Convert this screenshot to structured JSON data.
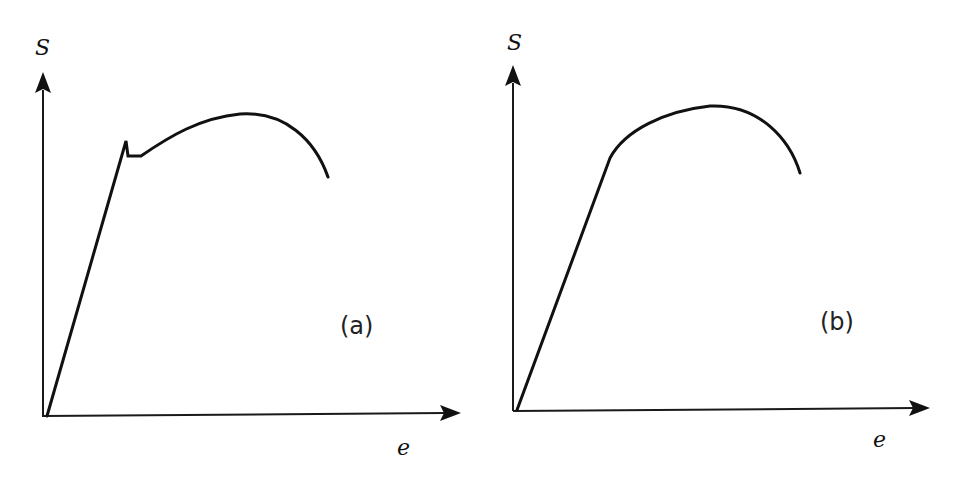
{
  "figure": {
    "panels": [
      {
        "id": "a",
        "label": "(a)",
        "y_axis_label": "S",
        "x_axis_label": "e",
        "curve_type": "discontinuous-yield"
      },
      {
        "id": "b",
        "label": "(b)",
        "y_axis_label": "S",
        "x_axis_label": "e",
        "curve_type": "continuous-yield"
      }
    ],
    "colors": {
      "line": "#111111",
      "background": "#ffffff"
    }
  }
}
